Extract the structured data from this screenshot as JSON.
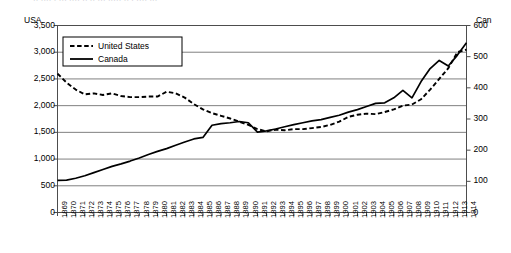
{
  "caption": {
    "text": "·· ···· · ··· ···· ·· ·· ··· ····· ·· · ···· ···"
  },
  "chart_data": {
    "type": "line",
    "title": "",
    "xlabel": "",
    "ylabel": "USA",
    "y2label": "Can",
    "grid": true,
    "legend_position": "top-left",
    "axes": {
      "left": {
        "name": "USA",
        "ylim": [
          0,
          3500
        ],
        "ticks": [
          0,
          500,
          1000,
          1500,
          2000,
          2500,
          3000,
          3500
        ],
        "tick_labels": [
          "0",
          "500",
          "1,000",
          "1,500",
          "2,000",
          "2,500",
          "3,000",
          "3,500"
        ]
      },
      "right": {
        "name": "Can",
        "ylim": [
          0,
          600
        ],
        "ticks": [
          0,
          100,
          200,
          300,
          400,
          500,
          600
        ],
        "tick_labels": [
          "0",
          "100",
          "200",
          "300",
          "400",
          "500",
          "600"
        ]
      }
    },
    "categories": [
      "1869",
      "1870",
      "1871",
      "1872",
      "1873",
      "1874",
      "1875",
      "1876",
      "1877",
      "1878",
      "1879",
      "1880",
      "1881",
      "1882",
      "1883",
      "1884",
      "1885",
      "1886",
      "1887",
      "1888",
      "1889",
      "1890",
      "1891",
      "1892",
      "1893",
      "1894",
      "1895",
      "1896",
      "1897",
      "1898",
      "1899",
      "1900",
      "1901",
      "1902",
      "1903",
      "1904",
      "1905",
      "1906",
      "1907",
      "1908",
      "1909",
      "1910",
      "1911",
      "1912",
      "1913",
      "1914"
    ],
    "series": [
      {
        "name": "United States",
        "axis": "left",
        "style": "dashed",
        "color": "#000000",
        "values": [
          2600,
          2430,
          2300,
          2210,
          2230,
          2200,
          2230,
          2180,
          2160,
          2160,
          2170,
          2170,
          2260,
          2230,
          2150,
          2030,
          1930,
          1860,
          1810,
          1760,
          1700,
          1640,
          1560,
          1520,
          1550,
          1540,
          1560,
          1560,
          1580,
          1600,
          1640,
          1700,
          1790,
          1830,
          1850,
          1840,
          1880,
          1930,
          2000,
          2020,
          2120,
          2300,
          2500,
          2700,
          3000,
          3050
        ]
      },
      {
        "name": "Canada",
        "axis": "right",
        "style": "solid",
        "color": "#000000",
        "values": [
          103,
          104,
          110,
          118,
          128,
          138,
          148,
          156,
          165,
          175,
          186,
          196,
          205,
          216,
          226,
          236,
          241,
          280,
          285,
          288,
          292,
          288,
          258,
          262,
          268,
          275,
          282,
          288,
          294,
          298,
          305,
          312,
          322,
          330,
          340,
          350,
          352,
          368,
          392,
          368,
          420,
          462,
          488,
          470,
          505,
          545
        ]
      }
    ]
  },
  "legend": {
    "entries": [
      {
        "label": "United States",
        "style": "dashed"
      },
      {
        "label": "Canada",
        "style": "solid"
      }
    ]
  }
}
